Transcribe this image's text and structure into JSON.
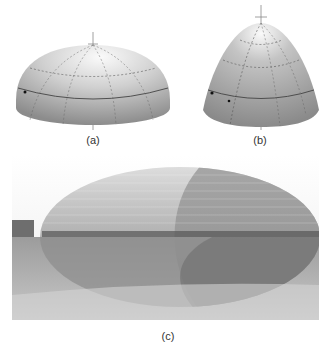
{
  "figures": [
    {
      "id": "a",
      "label": "(a)",
      "description": "half-ellipsoid dome with grid lines"
    },
    {
      "id": "b",
      "label": "(b)",
      "description": "paraboloid dome with grid lines"
    },
    {
      "id": "c",
      "label": "(c)",
      "description": "photo of elliptical domed building reflected in water"
    }
  ],
  "colors": {
    "surface_light": "#f4f4f4",
    "surface_dark": "#8a8a8a",
    "grid": "#555555",
    "photo_sky": "#f2f2f2",
    "photo_water": "#9a9a9a"
  }
}
